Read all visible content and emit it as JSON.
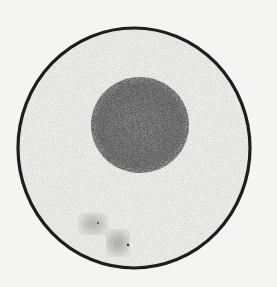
{
  "image": {
    "subject": "cell micrograph",
    "description": "Grayscale micrograph of a round cell with a thick dark membrane outline and a darker, granular spherical nucleus located above center; faint dark smudges near the lower-left interior.",
    "elements": [
      "cell-membrane",
      "cytoplasm",
      "nucleus",
      "granular-smudges"
    ],
    "colors": {
      "background": "#f4f4f2",
      "cytoplasm": "#efefec",
      "membrane": "#1e1e1e",
      "nucleus": "#6e6e6e"
    }
  }
}
